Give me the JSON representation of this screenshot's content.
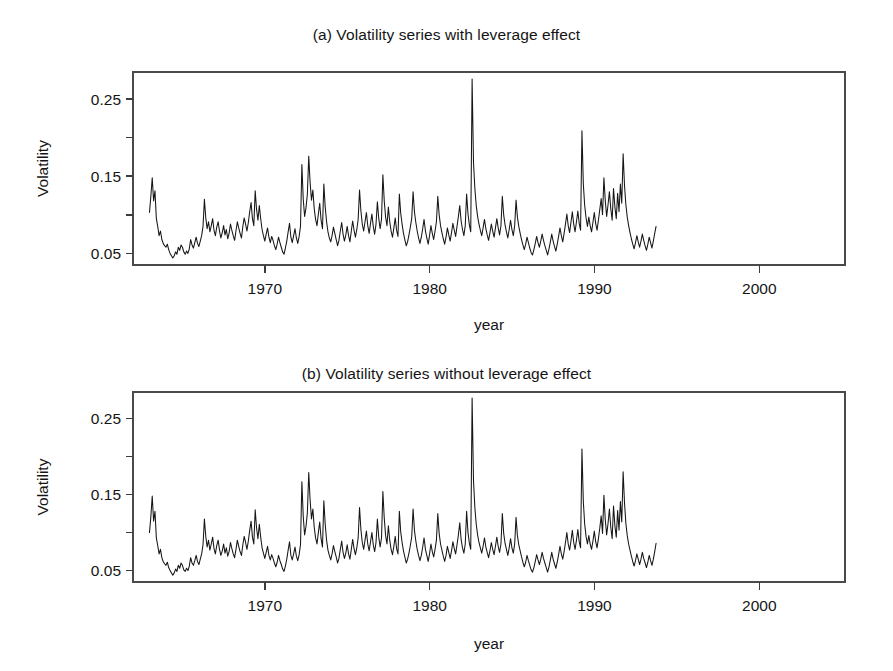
{
  "figure": {
    "background": "#ffffff",
    "line_color": "#161616",
    "axis_color": "#4a4a4a"
  },
  "panels": [
    {
      "id": "a",
      "title": "(a) Volatility series with leverage effect",
      "xlabel": "year",
      "ylabel": "Volatility"
    },
    {
      "id": "b",
      "title": "(b) Volatility series without leverage effect",
      "xlabel": "year",
      "ylabel": "Volatility"
    }
  ],
  "chart_data": [
    {
      "type": "line",
      "panel": "a",
      "title": "(a) Volatility series with leverage effect",
      "xlabel": "year",
      "ylabel": "Volatility",
      "xlim": [
        1962.0,
        2005.2
      ],
      "ylim": [
        0.035,
        0.285
      ],
      "xticks": [
        1970,
        1980,
        1990,
        2000
      ],
      "xtick_labels": [
        "1970",
        "1980",
        "1990",
        "2000"
      ],
      "yticks": [
        0.05,
        0.1,
        0.15,
        0.2,
        0.25
      ],
      "ytick_labels": [
        "0.05",
        "",
        "0.15",
        "",
        "0.25"
      ],
      "minor_yticks": [
        0.1,
        0.2
      ],
      "grid": false,
      "legend": null,
      "x_start": 1963.0,
      "x_step": 0.0833,
      "series": [
        {
          "name": "volatility_with_leverage",
          "values": [
            0.103,
            0.124,
            0.148,
            0.118,
            0.131,
            0.095,
            0.085,
            0.073,
            0.079,
            0.068,
            0.063,
            0.06,
            0.058,
            0.062,
            0.055,
            0.05,
            0.047,
            0.044,
            0.047,
            0.052,
            0.049,
            0.058,
            0.054,
            0.061,
            0.058,
            0.052,
            0.049,
            0.053,
            0.05,
            0.056,
            0.068,
            0.061,
            0.057,
            0.064,
            0.071,
            0.063,
            0.059,
            0.066,
            0.073,
            0.085,
            0.12,
            0.096,
            0.082,
            0.091,
            0.078,
            0.086,
            0.095,
            0.08,
            0.073,
            0.084,
            0.091,
            0.079,
            0.07,
            0.077,
            0.086,
            0.074,
            0.081,
            0.069,
            0.076,
            0.088,
            0.08,
            0.073,
            0.067,
            0.079,
            0.091,
            0.083,
            0.076,
            0.07,
            0.085,
            0.096,
            0.088,
            0.079,
            0.09,
            0.104,
            0.116,
            0.095,
            0.086,
            0.131,
            0.107,
            0.093,
            0.112,
            0.095,
            0.081,
            0.073,
            0.066,
            0.075,
            0.083,
            0.071,
            0.064,
            0.072,
            0.067,
            0.06,
            0.055,
            0.062,
            0.071,
            0.064,
            0.058,
            0.052,
            0.049,
            0.057,
            0.066,
            0.078,
            0.089,
            0.071,
            0.064,
            0.073,
            0.082,
            0.07,
            0.063,
            0.072,
            0.085,
            0.165,
            0.12,
            0.098,
            0.109,
            0.127,
            0.176,
            0.142,
            0.119,
            0.132,
            0.108,
            0.094,
            0.086,
            0.101,
            0.115,
            0.093,
            0.082,
            0.14,
            0.11,
            0.091,
            0.078,
            0.07,
            0.065,
            0.073,
            0.084,
            0.076,
            0.068,
            0.06,
            0.067,
            0.079,
            0.09,
            0.075,
            0.066,
            0.074,
            0.085,
            0.073,
            0.065,
            0.079,
            0.092,
            0.08,
            0.071,
            0.081,
            0.094,
            0.132,
            0.105,
            0.088,
            0.079,
            0.091,
            0.103,
            0.086,
            0.076,
            0.089,
            0.101,
            0.085,
            0.075,
            0.088,
            0.117,
            0.095,
            0.082,
            0.094,
            0.152,
            0.118,
            0.097,
            0.086,
            0.11,
            0.091,
            0.079,
            0.071,
            0.083,
            0.096,
            0.08,
            0.072,
            0.127,
            0.102,
            0.088,
            0.076,
            0.068,
            0.06,
            0.065,
            0.074,
            0.084,
            0.095,
            0.13,
            0.104,
            0.09,
            0.079,
            0.07,
            0.063,
            0.071,
            0.082,
            0.094,
            0.079,
            0.07,
            0.062,
            0.073,
            0.086,
            0.076,
            0.068,
            0.079,
            0.091,
            0.124,
            0.1,
            0.086,
            0.077,
            0.069,
            0.062,
            0.071,
            0.083,
            0.074,
            0.066,
            0.077,
            0.089,
            0.08,
            0.072,
            0.085,
            0.098,
            0.112,
            0.092,
            0.081,
            0.073,
            0.086,
            0.127,
            0.101,
            0.087,
            0.078,
            0.276,
            0.168,
            0.134,
            0.112,
            0.098,
            0.088,
            0.08,
            0.073,
            0.083,
            0.094,
            0.082,
            0.074,
            0.067,
            0.077,
            0.088,
            0.079,
            0.071,
            0.083,
            0.095,
            0.083,
            0.074,
            0.086,
            0.124,
            0.1,
            0.087,
            0.078,
            0.07,
            0.081,
            0.093,
            0.081,
            0.073,
            0.086,
            0.119,
            0.097,
            0.085,
            0.076,
            0.068,
            0.061,
            0.055,
            0.062,
            0.071,
            0.064,
            0.057,
            0.051,
            0.048,
            0.055,
            0.063,
            0.072,
            0.064,
            0.058,
            0.066,
            0.075,
            0.067,
            0.06,
            0.054,
            0.048,
            0.056,
            0.065,
            0.075,
            0.066,
            0.059,
            0.053,
            0.062,
            0.072,
            0.083,
            0.073,
            0.065,
            0.076,
            0.088,
            0.101,
            0.086,
            0.077,
            0.09,
            0.104,
            0.088,
            0.078,
            0.091,
            0.105,
            0.089,
            0.08,
            0.209,
            0.14,
            0.112,
            0.096,
            0.085,
            0.097,
            0.086,
            0.078,
            0.09,
            0.103,
            0.089,
            0.08,
            0.093,
            0.107,
            0.121,
            0.1,
            0.148,
            0.118,
            0.098,
            0.113,
            0.13,
            0.108,
            0.093,
            0.134,
            0.11,
            0.095,
            0.128,
            0.104,
            0.14,
            0.115,
            0.179,
            0.138,
            0.113,
            0.097,
            0.086,
            0.077,
            0.069,
            0.062,
            0.056,
            0.064,
            0.073,
            0.065,
            0.058,
            0.066,
            0.075,
            0.067,
            0.06,
            0.054,
            0.062,
            0.071,
            0.064,
            0.057,
            0.066,
            0.076,
            0.085
          ]
        }
      ]
    },
    {
      "type": "line",
      "panel": "b",
      "title": "(b) Volatility series without leverage effect",
      "xlabel": "year",
      "ylabel": "Volatility",
      "xlim": [
        1962.0,
        2005.2
      ],
      "ylim": [
        0.035,
        0.285
      ],
      "xticks": [
        1970,
        1980,
        1990,
        2000
      ],
      "xtick_labels": [
        "1970",
        "1980",
        "1990",
        "2000"
      ],
      "yticks": [
        0.05,
        0.1,
        0.15,
        0.2,
        0.25
      ],
      "ytick_labels": [
        "0.05",
        "",
        "0.15",
        "",
        "0.25"
      ],
      "minor_yticks": [
        0.1,
        0.2
      ],
      "grid": false,
      "legend": null,
      "x_start": 1963.0,
      "x_step": 0.0833,
      "series": [
        {
          "name": "volatility_without_leverage",
          "values": [
            0.1,
            0.121,
            0.148,
            0.115,
            0.128,
            0.093,
            0.083,
            0.072,
            0.078,
            0.067,
            0.062,
            0.059,
            0.057,
            0.061,
            0.054,
            0.05,
            0.047,
            0.044,
            0.047,
            0.052,
            0.049,
            0.057,
            0.053,
            0.06,
            0.057,
            0.051,
            0.049,
            0.053,
            0.05,
            0.056,
            0.067,
            0.06,
            0.057,
            0.063,
            0.07,
            0.062,
            0.058,
            0.065,
            0.072,
            0.084,
            0.118,
            0.095,
            0.081,
            0.09,
            0.077,
            0.085,
            0.094,
            0.079,
            0.072,
            0.083,
            0.09,
            0.078,
            0.07,
            0.076,
            0.085,
            0.073,
            0.08,
            0.069,
            0.075,
            0.087,
            0.079,
            0.072,
            0.067,
            0.078,
            0.09,
            0.082,
            0.075,
            0.07,
            0.084,
            0.095,
            0.087,
            0.078,
            0.089,
            0.103,
            0.115,
            0.094,
            0.085,
            0.13,
            0.106,
            0.092,
            0.111,
            0.094,
            0.08,
            0.073,
            0.066,
            0.074,
            0.082,
            0.07,
            0.064,
            0.071,
            0.066,
            0.06,
            0.055,
            0.061,
            0.07,
            0.063,
            0.058,
            0.052,
            0.049,
            0.056,
            0.065,
            0.077,
            0.088,
            0.07,
            0.064,
            0.072,
            0.081,
            0.069,
            0.063,
            0.071,
            0.084,
            0.167,
            0.121,
            0.097,
            0.108,
            0.126,
            0.179,
            0.143,
            0.118,
            0.131,
            0.107,
            0.093,
            0.085,
            0.1,
            0.114,
            0.092,
            0.081,
            0.142,
            0.111,
            0.09,
            0.077,
            0.07,
            0.064,
            0.072,
            0.083,
            0.075,
            0.068,
            0.06,
            0.066,
            0.078,
            0.089,
            0.074,
            0.066,
            0.073,
            0.084,
            0.072,
            0.065,
            0.078,
            0.091,
            0.079,
            0.071,
            0.08,
            0.093,
            0.133,
            0.104,
            0.087,
            0.078,
            0.09,
            0.102,
            0.085,
            0.076,
            0.088,
            0.1,
            0.084,
            0.075,
            0.087,
            0.118,
            0.094,
            0.081,
            0.093,
            0.154,
            0.119,
            0.096,
            0.085,
            0.109,
            0.09,
            0.078,
            0.071,
            0.082,
            0.095,
            0.079,
            0.072,
            0.128,
            0.101,
            0.087,
            0.076,
            0.068,
            0.06,
            0.065,
            0.073,
            0.083,
            0.094,
            0.131,
            0.103,
            0.089,
            0.078,
            0.07,
            0.063,
            0.07,
            0.081,
            0.093,
            0.078,
            0.07,
            0.062,
            0.072,
            0.085,
            0.075,
            0.068,
            0.078,
            0.09,
            0.125,
            0.099,
            0.085,
            0.077,
            0.069,
            0.062,
            0.07,
            0.082,
            0.074,
            0.066,
            0.076,
            0.088,
            0.079,
            0.072,
            0.084,
            0.097,
            0.113,
            0.091,
            0.08,
            0.073,
            0.085,
            0.128,
            0.1,
            0.086,
            0.078,
            0.277,
            0.169,
            0.133,
            0.111,
            0.097,
            0.087,
            0.08,
            0.073,
            0.082,
            0.093,
            0.081,
            0.074,
            0.067,
            0.076,
            0.087,
            0.078,
            0.071,
            0.082,
            0.094,
            0.082,
            0.074,
            0.085,
            0.125,
            0.099,
            0.086,
            0.078,
            0.07,
            0.08,
            0.092,
            0.08,
            0.073,
            0.085,
            0.12,
            0.096,
            0.084,
            0.076,
            0.068,
            0.061,
            0.055,
            0.061,
            0.07,
            0.063,
            0.057,
            0.051,
            0.048,
            0.054,
            0.062,
            0.071,
            0.064,
            0.058,
            0.065,
            0.074,
            0.066,
            0.06,
            0.054,
            0.048,
            0.055,
            0.064,
            0.074,
            0.065,
            0.059,
            0.053,
            0.061,
            0.071,
            0.082,
            0.072,
            0.065,
            0.075,
            0.087,
            0.1,
            0.085,
            0.077,
            0.089,
            0.103,
            0.087,
            0.078,
            0.09,
            0.104,
            0.088,
            0.08,
            0.21,
            0.141,
            0.111,
            0.095,
            0.085,
            0.096,
            0.085,
            0.078,
            0.089,
            0.102,
            0.088,
            0.08,
            0.092,
            0.106,
            0.122,
            0.099,
            0.149,
            0.117,
            0.097,
            0.112,
            0.131,
            0.107,
            0.092,
            0.135,
            0.109,
            0.094,
            0.129,
            0.103,
            0.141,
            0.114,
            0.18,
            0.139,
            0.112,
            0.096,
            0.085,
            0.077,
            0.069,
            0.062,
            0.056,
            0.063,
            0.072,
            0.065,
            0.058,
            0.065,
            0.074,
            0.066,
            0.06,
            0.054,
            0.061,
            0.07,
            0.063,
            0.057,
            0.065,
            0.075,
            0.086
          ]
        }
      ]
    }
  ]
}
